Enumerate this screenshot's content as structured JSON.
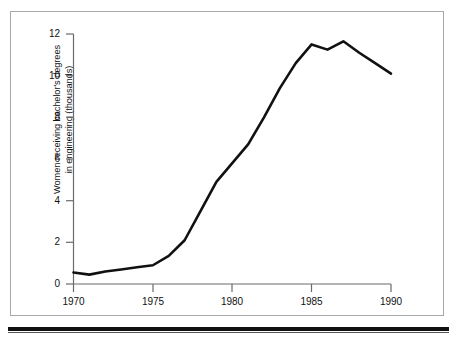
{
  "figure": {
    "background_color": "#ffffff",
    "frame_color": "#a8a8a8",
    "rule_color": "#111111"
  },
  "chart_data": {
    "type": "line",
    "title": "",
    "subtitle": "",
    "xlabel": "",
    "ylabel": "Women receiving bachelor's degrees\nin engineering (thousands)",
    "ylabel_line1": "Women receiving bachelor's degrees",
    "ylabel_line2": "in engineering (thousands)",
    "xlim": [
      1970,
      1990
    ],
    "ylim": [
      0,
      12
    ],
    "xticks": [
      1970,
      1975,
      1980,
      1985,
      1990
    ],
    "xtick_labels": [
      "1970",
      "1975",
      "1980",
      "1985",
      "1990"
    ],
    "yticks": [
      0,
      2,
      4,
      6,
      8,
      10,
      12
    ],
    "ytick_labels": [
      "0",
      "2",
      "4",
      "6",
      "8",
      "10",
      "12"
    ],
    "grid": false,
    "legend": null,
    "legend_position": "none",
    "line_color": "#111111",
    "line_width": 2.6,
    "series": [
      {
        "name": "Women receiving bachelor's degrees in engineering (thousands)",
        "x": [
          1970,
          1971,
          1972,
          1973,
          1974,
          1975,
          1976,
          1977,
          1978,
          1979,
          1980,
          1981,
          1982,
          1983,
          1984,
          1985,
          1986,
          1987,
          1988,
          1989,
          1990
        ],
        "values": [
          0.55,
          0.45,
          0.6,
          0.7,
          0.8,
          0.9,
          1.35,
          2.1,
          3.5,
          4.9,
          5.8,
          6.7,
          8.0,
          9.4,
          10.6,
          11.5,
          11.25,
          11.65,
          11.1,
          10.6,
          10.1
        ]
      }
    ]
  },
  "axes": {
    "y_axis_name": "value-axis",
    "x_axis_name": "year-axis"
  }
}
